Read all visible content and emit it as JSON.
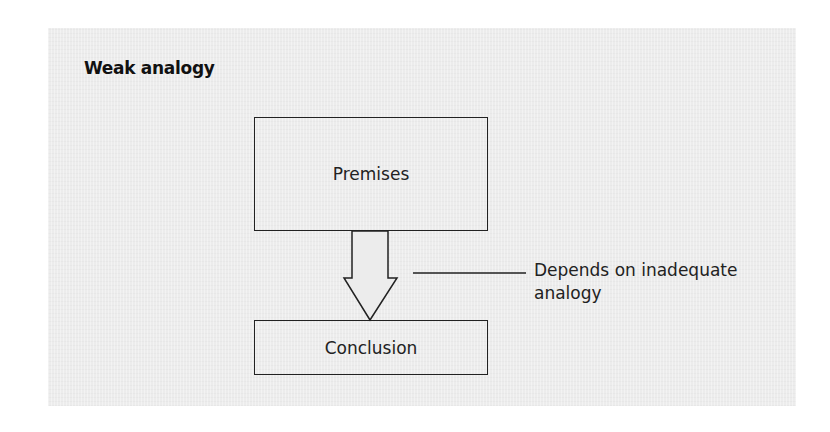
{
  "diagram": {
    "title": "Weak analogy",
    "nodes": {
      "premises": "Premises",
      "conclusion": "Conclusion"
    },
    "arrow": {
      "from": "premises",
      "to": "conclusion",
      "style": "hollow-block-arrow"
    },
    "annotation": {
      "line1": "Depends on inadequate",
      "line2": "analogy",
      "points_to": "arrow"
    },
    "colors": {
      "background": "#ececec",
      "stroke": "#222222",
      "text": "#222222"
    }
  }
}
